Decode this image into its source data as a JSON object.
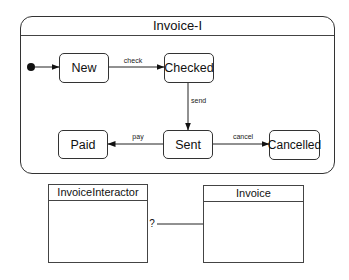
{
  "state_machine": {
    "title": "Invoice-I",
    "initial": "initial-state",
    "states": [
      {
        "id": "new",
        "label": "New"
      },
      {
        "id": "checked",
        "label": "Checked"
      },
      {
        "id": "sent",
        "label": "Sent"
      },
      {
        "id": "paid",
        "label": "Paid"
      },
      {
        "id": "cancelled",
        "label": "Cancelled"
      }
    ],
    "transitions": [
      {
        "from": "initial-state",
        "to": "New",
        "label": ""
      },
      {
        "from": "New",
        "to": "Checked",
        "label": "check"
      },
      {
        "from": "Checked",
        "to": "Sent",
        "label": "send"
      },
      {
        "from": "Sent",
        "to": "Paid",
        "label": "pay"
      },
      {
        "from": "Sent",
        "to": "Cancelled",
        "label": "cancel"
      }
    ]
  },
  "classes": [
    {
      "name": "InvoiceInteractor"
    },
    {
      "name": "Invoice"
    }
  ],
  "association": {
    "from": "InvoiceInteractor",
    "to": "Invoice",
    "label": "?"
  }
}
